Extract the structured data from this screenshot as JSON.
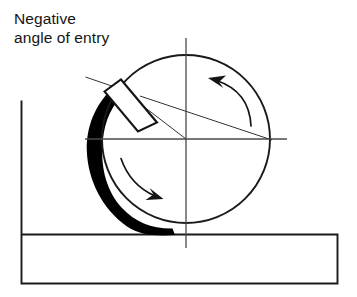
{
  "diagram": {
    "title_lines": [
      "Negative",
      "angle of entry"
    ],
    "label_line_1": "Negative",
    "label_line_2": "angle of entry",
    "colors": {
      "outline": "#1a1a1a",
      "chip": "#000000",
      "centerline": "#4a4a4a",
      "background": "#ffffff",
      "text": "#141414"
    },
    "parts": {
      "cutter_name": "milling-cutter-circle",
      "insert_name": "cutting-insert",
      "chip_name": "chip-crescent",
      "workpiece_name": "workpiece-block",
      "rotation_upper": "rotation-arrow-upper",
      "rotation_lower": "rotation-arrow-lower",
      "vertical_centerline": "vertical-centerline",
      "horizontal_centerline": "horizontal-centerline",
      "radial_line": "insert-radial-line",
      "entry_angle_line": "entry-angle-line"
    },
    "geometry": {
      "cutter_center_x": 186,
      "cutter_center_y": 139,
      "cutter_radius": 84
    }
  }
}
